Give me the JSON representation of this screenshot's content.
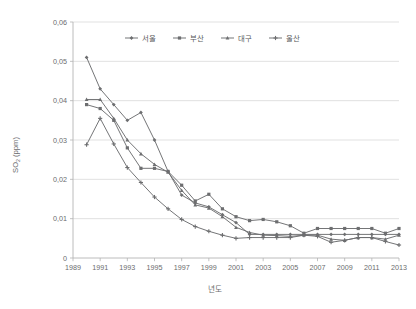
{
  "chart_data": {
    "type": "line",
    "title": "",
    "xlabel": "년도",
    "ylabel": "SO2 (ppm)",
    "ylabel_main": "SO",
    "ylabel_sub": "2",
    "ylabel_unit": " (ppm)",
    "xlim": [
      1989,
      2013
    ],
    "ylim": [
      0,
      0.06
    ],
    "grid": "horizontal",
    "legend_position": "top-center",
    "y_ticks": [
      "0",
      "0,01",
      "0,02",
      "0,03",
      "0,04",
      "0,05",
      "0,06"
    ],
    "y_tick_values": [
      0,
      0.01,
      0.02,
      0.03,
      0.04,
      0.05,
      0.06
    ],
    "x_ticks": [
      "1989",
      "1991",
      "1993",
      "1995",
      "1997",
      "1999",
      "2001",
      "2003",
      "2005",
      "2007",
      "2009",
      "2011",
      "2013"
    ],
    "x_tick_values": [
      1989,
      1991,
      1993,
      1995,
      1997,
      1999,
      2001,
      2003,
      2005,
      2007,
      2009,
      2011,
      2013
    ],
    "x": [
      1990,
      1991,
      1992,
      1993,
      1994,
      1995,
      1996,
      1997,
      1998,
      1999,
      2000,
      2001,
      2002,
      2003,
      2004,
      2005,
      2006,
      2007,
      2008,
      2009,
      2010,
      2011,
      2012,
      2013
    ],
    "series": [
      {
        "name": "서울",
        "color": "#6d6e70",
        "marker": "diamond",
        "values": [
          0.051,
          0.043,
          0.039,
          0.035,
          0.037,
          0.03,
          0.022,
          0.016,
          0.014,
          0.013,
          0.011,
          0.009,
          0.006,
          0.006,
          0.006,
          0.006,
          0.006,
          0.006,
          0.006,
          0.006,
          0.006,
          0.006,
          0.006,
          0.006
        ]
      },
      {
        "name": "부산",
        "color": "#6d6e70",
        "marker": "square",
        "values": [
          0.039,
          0.038,
          0.035,
          0.028,
          0.0228,
          0.0228,
          0.022,
          0.0185,
          0.0145,
          0.0162,
          0.0125,
          0.0105,
          0.0095,
          0.0098,
          0.0092,
          0.0082,
          0.0063,
          0.0075,
          0.0075,
          0.0075,
          0.0075,
          0.0075,
          0.0063,
          0.0075
        ]
      },
      {
        "name": "대구",
        "color": "#6d6e70",
        "marker": "triangle",
        "values": [
          0.0403,
          0.0403,
          0.0355,
          0.03,
          0.0265,
          0.0238,
          0.0218,
          0.0172,
          0.0135,
          0.0127,
          0.0105,
          0.0078,
          0.0065,
          0.0058,
          0.0057,
          0.0055,
          0.0058,
          0.0058,
          0.0048,
          0.0045,
          0.0052,
          0.0052,
          0.0048,
          0.0058
        ]
      },
      {
        "name": "울산",
        "color": "#6d6e70",
        "marker": "cross",
        "values": [
          0.0288,
          0.0355,
          0.029,
          0.023,
          0.0192,
          0.0155,
          0.0125,
          0.0098,
          0.008,
          0.0068,
          0.0058,
          0.005,
          0.0052,
          0.0052,
          0.0052,
          0.0052,
          0.0058,
          0.0055,
          0.004,
          0.0045,
          0.0052,
          0.0052,
          0.0042,
          0.0033
        ]
      }
    ]
  }
}
